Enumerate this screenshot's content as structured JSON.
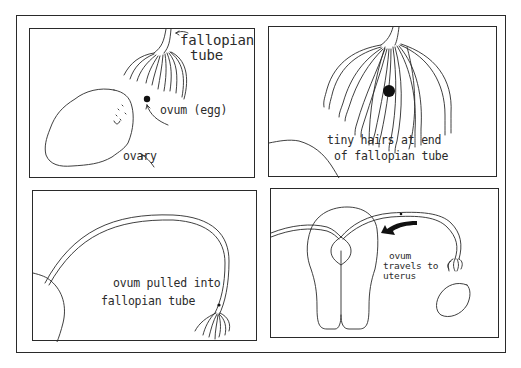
{
  "figure": {
    "colors": {
      "ink": "#2a2a2a",
      "background": "#ffffff"
    },
    "panels": [
      {
        "id": 1,
        "labels": {
          "fallopian_tube_line1": "fallopian",
          "fallopian_tube_line2": "tube",
          "ovum": "ovum (egg)",
          "ovary": "ovary"
        }
      },
      {
        "id": 2,
        "labels": {
          "line1": "tiny hairs at end",
          "line2": "of fallopian tube"
        }
      },
      {
        "id": 3,
        "labels": {
          "line1": "ovum pulled into",
          "line2": "fallopian tube"
        }
      },
      {
        "id": 4,
        "labels": {
          "line1": "ovum",
          "line2": "travels to",
          "line3": "uterus"
        }
      }
    ]
  }
}
